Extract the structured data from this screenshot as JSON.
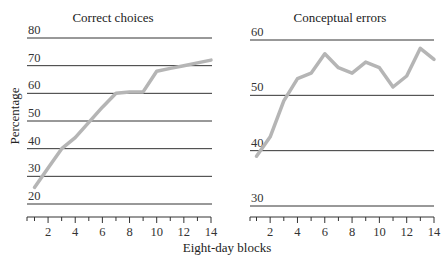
{
  "chart_data": [
    {
      "type": "line",
      "title": "Correct choices",
      "xlabel": "Eight-day blocks",
      "ylabel": "Percentage",
      "x": [
        1,
        2,
        3,
        4,
        5,
        6,
        7,
        8,
        9,
        10,
        11,
        12,
        13,
        14
      ],
      "values": [
        26,
        33,
        40,
        44,
        49.5,
        55,
        60,
        60.5,
        60.5,
        68,
        69,
        70,
        71,
        72
      ],
      "xticks": [
        2,
        4,
        6,
        8,
        10,
        12,
        14
      ],
      "yticks": [
        20,
        30,
        40,
        50,
        60,
        70,
        80
      ],
      "ylim": [
        20,
        80
      ],
      "xlim": [
        0.5,
        14
      ],
      "grid": true,
      "series_color": "#b5b5b5"
    },
    {
      "type": "line",
      "title": "Conceptual errors",
      "xlabel": "Eight-day blocks",
      "ylabel": "Percentage",
      "x": [
        1,
        2,
        3,
        4,
        5,
        6,
        7,
        8,
        9,
        10,
        11,
        12,
        13,
        14
      ],
      "values": [
        39,
        42.5,
        49,
        53,
        54,
        57.5,
        55,
        54,
        56,
        55,
        51.5,
        53.5,
        58.5,
        56.5
      ],
      "xticks": [
        2,
        4,
        6,
        8,
        10,
        12,
        14
      ],
      "yticks": [
        30,
        40,
        50,
        60
      ],
      "ylim": [
        30,
        60
      ],
      "xlim": [
        0.5,
        14
      ],
      "grid": true,
      "series_color": "#b5b5b5"
    }
  ],
  "shared": {
    "xlabel": "Eight-day blocks",
    "ylabel": "Percentage"
  }
}
